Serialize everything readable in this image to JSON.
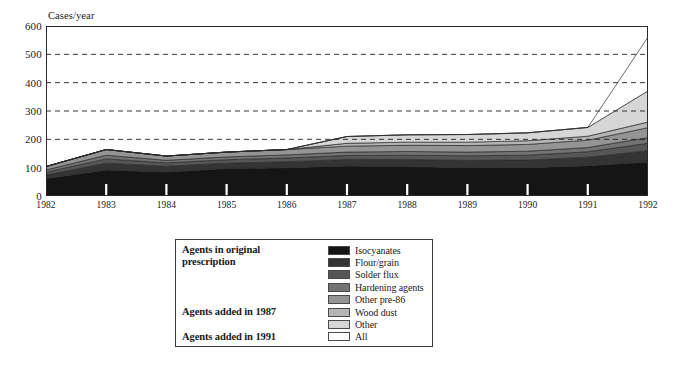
{
  "chart_data": {
    "type": "area",
    "title": "",
    "xlabel": "",
    "ylabel": "Cases/year",
    "categories": [
      1982,
      1983,
      1984,
      1985,
      1986,
      1987,
      1988,
      1989,
      1990,
      1991,
      1992
    ],
    "tick_labels": [
      "1982",
      "1983",
      "1984",
      "1985",
      "1986",
      "1987",
      "1988",
      "1989",
      "1990",
      "1991",
      "1992"
    ],
    "y_ticks": [
      0,
      100,
      200,
      300,
      400,
      500,
      600
    ],
    "y_tick_labels": [
      "0",
      "100",
      "200",
      "300",
      "400",
      "500",
      "600"
    ],
    "ylim": [
      0,
      600
    ],
    "grid": "horizontal-dashed",
    "gridlines_at": [
      200,
      300,
      400,
      500
    ],
    "stacked": true,
    "legend_position": "below-chart",
    "series": [
      {
        "name": "Isocyanates",
        "color": "#151515",
        "values": [
          62,
          92,
          85,
          97,
          100,
          106,
          104,
          100,
          100,
          107,
          120
        ]
      },
      {
        "name": "Flour/grain",
        "color": "#343434",
        "values": [
          12,
          24,
          20,
          19,
          21,
          23,
          25,
          26,
          27,
          30,
          40
        ]
      },
      {
        "name": "Solder flux",
        "color": "#565656",
        "values": [
          10,
          15,
          12,
          12,
          13,
          14,
          15,
          16,
          17,
          19,
          26
        ]
      },
      {
        "name": "Hardening agents",
        "color": "#737373",
        "values": [
          8,
          13,
          9,
          10,
          11,
          12,
          13,
          13,
          14,
          15,
          20
        ]
      },
      {
        "name": "Other pre-86",
        "color": "#949494",
        "values": [
          12,
          20,
          15,
          17,
          19,
          21,
          22,
          23,
          24,
          26,
          35
        ]
      },
      {
        "name": "Wood dust",
        "color": "#b5b5b5",
        "values": [
          0,
          0,
          0,
          0,
          0,
          10,
          11,
          12,
          13,
          14,
          20
        ]
      },
      {
        "name": "Other",
        "color": "#d6d6d6",
        "values": [
          0,
          0,
          0,
          0,
          0,
          24,
          26,
          27,
          28,
          31,
          110
        ]
      },
      {
        "name": "All",
        "color": "#ffffff",
        "values": [
          0,
          0,
          0,
          0,
          0,
          0,
          0,
          0,
          0,
          0,
          190
        ]
      }
    ],
    "totals": [
      104,
      164,
      141,
      155,
      164,
      210,
      216,
      217,
      223,
      242,
      561
    ]
  },
  "legend": {
    "groups": [
      {
        "label": "Agents in original",
        "label2": "prescription",
        "rows": 5
      },
      {
        "label": "Agents added in 1987",
        "rows": 2
      },
      {
        "label": "Agents added in 1991",
        "rows": 1
      }
    ],
    "group_labels": [
      "Agents in original",
      "prescription",
      "Agents added in 1987",
      "Agents added in 1991"
    ],
    "entries": [
      {
        "name": "Isocyanates",
        "color": "#151515"
      },
      {
        "name": "Flour/grain",
        "color": "#343434"
      },
      {
        "name": "Solder flux",
        "color": "#565656"
      },
      {
        "name": "Hardening agents",
        "color": "#737373"
      },
      {
        "name": "Other pre-86",
        "color": "#949494"
      },
      {
        "name": "Wood dust",
        "color": "#b5b5b5"
      },
      {
        "name": "Other",
        "color": "#d6d6d6"
      },
      {
        "name": "All",
        "color": "#ffffff"
      }
    ]
  }
}
